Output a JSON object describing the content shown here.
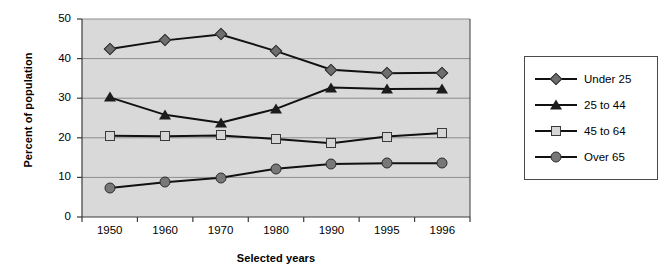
{
  "chart_data": {
    "type": "line",
    "title": "",
    "xlabel": "Selected years",
    "ylabel": "Percent of population",
    "categories": [
      "1950",
      "1960",
      "1970",
      "1980",
      "1990",
      "1995",
      "1996"
    ],
    "ylim": [
      0,
      50
    ],
    "ytick_labels": [
      "0",
      "10",
      "20",
      "30",
      "40",
      "50"
    ],
    "yticks": [
      0,
      10,
      20,
      30,
      40,
      50
    ],
    "grid": true,
    "legend_position": "right",
    "plot_background": "#d9d9d9",
    "series": [
      {
        "name": "Under 25",
        "marker": "diamond",
        "color": "#6e6e6e",
        "line_color": "#111111",
        "values": [
          42.4,
          44.6,
          46.1,
          41.9,
          37.2,
          36.3,
          36.4
        ]
      },
      {
        "name": "25 to 44",
        "marker": "triangle",
        "color": "#1c1c1c",
        "line_color": "#111111",
        "values": [
          30.2,
          25.8,
          23.8,
          27.3,
          32.7,
          32.3,
          32.4
        ]
      },
      {
        "name": "45 to 64",
        "marker": "square",
        "color": "#d6d6d6",
        "line_color": "#111111",
        "values": [
          20.5,
          20.4,
          20.6,
          19.7,
          18.6,
          20.3,
          21.2
        ]
      },
      {
        "name": "Over 65",
        "marker": "circle",
        "color": "#787878",
        "line_color": "#111111",
        "values": [
          7.3,
          8.8,
          9.9,
          12.2,
          13.4,
          13.6,
          13.6
        ]
      }
    ]
  }
}
